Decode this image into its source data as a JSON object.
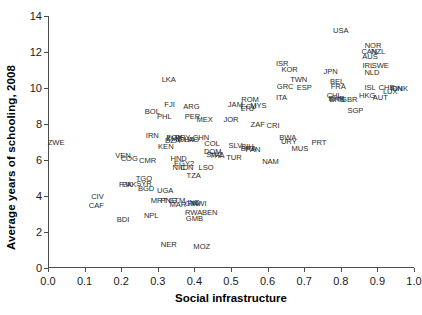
{
  "chart_data": {
    "type": "scatter",
    "title": "",
    "xlabel": "Social infrastructure",
    "ylabel": "Average years of schooling, 2008",
    "xlim": [
      0.0,
      1.0
    ],
    "ylim": [
      0,
      14
    ],
    "xticks": [
      "0.0",
      "0.1",
      "0.2",
      "0.3",
      "0.4",
      "0.5",
      "0.6",
      "0.7",
      "0.8",
      "0.9",
      "1.0"
    ],
    "xtick_values": [
      0.0,
      0.1,
      0.2,
      0.3,
      0.4,
      0.5,
      0.6,
      0.7,
      0.8,
      0.9,
      1.0
    ],
    "yticks": [
      "0",
      "2",
      "4",
      "6",
      "8",
      "10",
      "12",
      "14"
    ],
    "ytick_values": [
      0,
      2,
      4,
      6,
      8,
      10,
      12,
      14
    ],
    "grid": false,
    "legend": null,
    "marker_style": "text-label",
    "points": [
      {
        "label": "ZWE",
        "x": 0.022,
        "y": 6.95
      },
      {
        "label": "CIV",
        "x": 0.135,
        "y": 3.95
      },
      {
        "label": "CAF",
        "x": 0.132,
        "y": 3.45
      },
      {
        "label": "VEN",
        "x": 0.205,
        "y": 6.25
      },
      {
        "label": "COG",
        "x": 0.222,
        "y": 6.05
      },
      {
        "label": "CMR",
        "x": 0.272,
        "y": 5.95
      },
      {
        "label": "PAK",
        "x": 0.222,
        "y": 4.6
      },
      {
        "label": "FJK",
        "x": 0.212,
        "y": 4.6
      },
      {
        "label": "TGO",
        "x": 0.262,
        "y": 4.95
      },
      {
        "label": "SYR",
        "x": 0.262,
        "y": 4.65
      },
      {
        "label": "BGD",
        "x": 0.268,
        "y": 4.4
      },
      {
        "label": "BDI",
        "x": 0.205,
        "y": 2.65
      },
      {
        "label": "NPL",
        "x": 0.282,
        "y": 2.9
      },
      {
        "label": "MRT",
        "x": 0.303,
        "y": 3.7
      },
      {
        "label": "PNG",
        "x": 0.33,
        "y": 3.7
      },
      {
        "label": "GTM",
        "x": 0.352,
        "y": 3.7
      },
      {
        "label": "MWI",
        "x": 0.412,
        "y": 3.55
      },
      {
        "label": "MAR",
        "x": 0.355,
        "y": 3.5
      },
      {
        "label": "IND",
        "x": 0.398,
        "y": 3.6
      },
      {
        "label": "GIN",
        "x": 0.392,
        "y": 3.55
      },
      {
        "label": "RWA",
        "x": 0.398,
        "y": 3.05
      },
      {
        "label": "BEN",
        "x": 0.442,
        "y": 3.05
      },
      {
        "label": "GMB",
        "x": 0.4,
        "y": 2.7
      },
      {
        "label": "NER",
        "x": 0.33,
        "y": 1.3
      },
      {
        "label": "MOZ",
        "x": 0.42,
        "y": 1.15
      },
      {
        "label": "UGA",
        "x": 0.32,
        "y": 4.3
      },
      {
        "label": "IRN",
        "x": 0.285,
        "y": 7.35
      },
      {
        "label": "EGY",
        "x": 0.345,
        "y": 7.25
      },
      {
        "label": "ZMB",
        "x": 0.345,
        "y": 7.15
      },
      {
        "label": "DZA",
        "x": 0.34,
        "y": 7.08
      },
      {
        "label": "PRY",
        "x": 0.368,
        "y": 7.2
      },
      {
        "label": "GHA",
        "x": 0.378,
        "y": 7.1
      },
      {
        "label": "LAO",
        "x": 0.392,
        "y": 7.1
      },
      {
        "label": "CHN",
        "x": 0.418,
        "y": 7.2
      },
      {
        "label": "KEN",
        "x": 0.322,
        "y": 6.7
      },
      {
        "label": "COL",
        "x": 0.448,
        "y": 6.9
      },
      {
        "label": "DOM",
        "x": 0.45,
        "y": 6.45
      },
      {
        "label": "SWZ",
        "x": 0.455,
        "y": 6.3
      },
      {
        "label": "HND",
        "x": 0.357,
        "y": 6.05
      },
      {
        "label": "EGY2",
        "x": 0.372,
        "y": 5.8
      },
      {
        "label": "NIC",
        "x": 0.358,
        "y": 5.55
      },
      {
        "label": "IDN",
        "x": 0.38,
        "y": 5.55
      },
      {
        "label": "LSO",
        "x": 0.432,
        "y": 5.55
      },
      {
        "label": "TZA",
        "x": 0.398,
        "y": 5.1
      },
      {
        "label": "THA",
        "x": 0.462,
        "y": 6.2
      },
      {
        "label": "TUR",
        "x": 0.508,
        "y": 6.1
      },
      {
        "label": "SLV",
        "x": 0.512,
        "y": 6.8
      },
      {
        "label": "BRA",
        "x": 0.548,
        "y": 6.6
      },
      {
        "label": "BIH",
        "x": 0.545,
        "y": 6.7
      },
      {
        "label": "PAN",
        "x": 0.56,
        "y": 6.55
      },
      {
        "label": "BOL",
        "x": 0.285,
        "y": 8.65
      },
      {
        "label": "PHL",
        "x": 0.318,
        "y": 8.4
      },
      {
        "label": "FJI",
        "x": 0.332,
        "y": 9.05
      },
      {
        "label": "ARG",
        "x": 0.392,
        "y": 8.95
      },
      {
        "label": "PER",
        "x": 0.395,
        "y": 8.4
      },
      {
        "label": "MEX",
        "x": 0.428,
        "y": 8.25
      },
      {
        "label": "LKA",
        "x": 0.33,
        "y": 10.45
      },
      {
        "label": "JAM",
        "x": 0.512,
        "y": 9.05
      },
      {
        "label": "ROM",
        "x": 0.552,
        "y": 9.35
      },
      {
        "label": "ECU",
        "x": 0.548,
        "y": 8.95
      },
      {
        "label": "LTU",
        "x": 0.545,
        "y": 8.85
      },
      {
        "label": "MYS",
        "x": 0.575,
        "y": 9.0
      },
      {
        "label": "JOR",
        "x": 0.5,
        "y": 8.25
      },
      {
        "label": "ZAF",
        "x": 0.573,
        "y": 7.95
      },
      {
        "label": "CRI",
        "x": 0.615,
        "y": 7.9
      },
      {
        "label": "NAM",
        "x": 0.608,
        "y": 5.9
      },
      {
        "label": "MUS",
        "x": 0.688,
        "y": 6.6
      },
      {
        "label": "PRT",
        "x": 0.74,
        "y": 6.95
      },
      {
        "label": "BWA",
        "x": 0.655,
        "y": 7.2
      },
      {
        "label": "URY",
        "x": 0.658,
        "y": 7.0
      },
      {
        "label": "ISR",
        "x": 0.64,
        "y": 11.35
      },
      {
        "label": "KOR",
        "x": 0.66,
        "y": 11.0
      },
      {
        "label": "TWN",
        "x": 0.685,
        "y": 10.45
      },
      {
        "label": "GRC",
        "x": 0.648,
        "y": 10.05
      },
      {
        "label": "ESP",
        "x": 0.7,
        "y": 10.0
      },
      {
        "label": "ITA",
        "x": 0.638,
        "y": 9.45
      },
      {
        "label": "JPN",
        "x": 0.772,
        "y": 10.9
      },
      {
        "label": "BEL",
        "x": 0.79,
        "y": 10.35
      },
      {
        "label": "FRA",
        "x": 0.793,
        "y": 10.05
      },
      {
        "label": "CHL",
        "x": 0.782,
        "y": 9.55
      },
      {
        "label": "BHR",
        "x": 0.788,
        "y": 9.4
      },
      {
        "label": "BRB",
        "x": 0.79,
        "y": 9.35
      },
      {
        "label": "GBR",
        "x": 0.823,
        "y": 9.35
      },
      {
        "label": "SGP",
        "x": 0.84,
        "y": 8.7
      },
      {
        "label": "USA",
        "x": 0.8,
        "y": 13.15
      },
      {
        "label": "NOR",
        "x": 0.888,
        "y": 12.35
      },
      {
        "label": "CAN",
        "x": 0.878,
        "y": 12.0
      },
      {
        "label": "NZL",
        "x": 0.902,
        "y": 12.0
      },
      {
        "label": "AUS",
        "x": 0.88,
        "y": 11.7
      },
      {
        "label": "IRL",
        "x": 0.875,
        "y": 11.25
      },
      {
        "label": "SWE",
        "x": 0.908,
        "y": 11.25
      },
      {
        "label": "NLD",
        "x": 0.885,
        "y": 10.85
      },
      {
        "label": "ISL",
        "x": 0.88,
        "y": 10.0
      },
      {
        "label": "CHE",
        "x": 0.925,
        "y": 10.0
      },
      {
        "label": "DNK",
        "x": 0.962,
        "y": 9.95
      },
      {
        "label": "FIN",
        "x": 0.952,
        "y": 9.95
      },
      {
        "label": "LUX",
        "x": 0.935,
        "y": 9.8
      },
      {
        "label": "HKG",
        "x": 0.872,
        "y": 9.55
      },
      {
        "label": "AUT",
        "x": 0.908,
        "y": 9.45
      }
    ]
  },
  "figure": {
    "background_color": "#ffffff",
    "axis_color": "#4d4d4d",
    "label_color": "#2b2b2b"
  }
}
